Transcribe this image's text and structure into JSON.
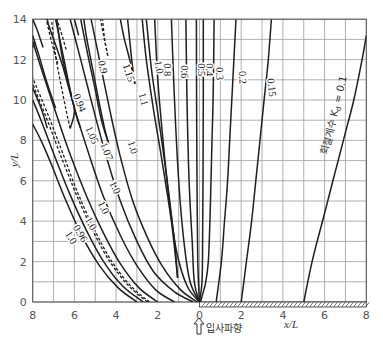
{
  "chart_data": {
    "type": "line",
    "title": "",
    "xlabel": "x/L",
    "ylabel": "y/L",
    "xlim": [
      -8,
      8
    ],
    "ylim": [
      0,
      14
    ],
    "x_ticks": [
      "8",
      "6",
      "4",
      "2",
      "0",
      "2",
      "4",
      "6",
      "8"
    ],
    "y_ticks": [
      "0",
      "2",
      "4",
      "6",
      "8",
      "10",
      "12",
      "14"
    ],
    "grid": true,
    "incident_wave_label": "입사파향",
    "breakwater": {
      "from_x": 0,
      "to_x": 8,
      "pattern": "hatched"
    },
    "legend_annotation": "회절계수 K",
    "legend_annotation_sub": "d",
    "legend_annotation_value": " = 0.1",
    "series": [
      {
        "name": "0.1",
        "style": "solid",
        "points": [
          [
            5.0,
            0
          ],
          [
            5.4,
            2
          ],
          [
            5.9,
            4
          ],
          [
            6.4,
            6
          ],
          [
            6.9,
            8
          ],
          [
            7.4,
            10
          ],
          [
            7.8,
            12
          ],
          [
            8.0,
            13.2
          ]
        ],
        "label": {
          "text": "회절계수 K_d = 0.1",
          "x": 6.6,
          "y": 9.2,
          "rot": -76
        }
      },
      {
        "name": "0.15",
        "style": "solid",
        "points": [
          [
            2.0,
            0
          ],
          [
            2.25,
            2
          ],
          [
            2.5,
            4
          ],
          [
            2.7,
            6
          ],
          [
            2.9,
            8
          ],
          [
            3.1,
            10
          ],
          [
            3.3,
            12
          ],
          [
            3.45,
            14
          ]
        ],
        "label": {
          "text": "0.15",
          "x": 3.3,
          "y": 10.6,
          "rot": 84
        }
      },
      {
        "name": "0.2",
        "style": "solid",
        "points": [
          [
            0.8,
            0
          ],
          [
            1.05,
            2
          ],
          [
            1.2,
            4
          ],
          [
            1.35,
            6
          ],
          [
            1.45,
            8
          ],
          [
            1.55,
            10
          ],
          [
            1.65,
            12
          ],
          [
            1.75,
            14
          ]
        ],
        "label": {
          "text": "0.2",
          "x": 1.9,
          "y": 11.1,
          "rot": 86
        }
      },
      {
        "name": "0.3",
        "style": "solid",
        "points": [
          [
            0.05,
            0
          ],
          [
            0.3,
            1
          ],
          [
            0.42,
            2
          ],
          [
            0.5,
            4
          ],
          [
            0.55,
            6
          ],
          [
            0.6,
            8
          ],
          [
            0.65,
            10
          ],
          [
            0.68,
            12
          ],
          [
            0.7,
            14
          ]
        ],
        "label": {
          "text": "0.3",
          "x": 0.8,
          "y": 11.3,
          "rot": 88
        }
      },
      {
        "name": "0.4",
        "style": "solid",
        "points": [
          [
            0,
            0
          ],
          [
            0.12,
            1
          ],
          [
            0.15,
            3
          ],
          [
            0.17,
            6
          ],
          [
            0.18,
            10
          ],
          [
            0.18,
            14
          ]
        ],
        "label": {
          "text": "0.4",
          "x": 0.3,
          "y": 11.5,
          "rot": 90
        }
      },
      {
        "name": "0.5",
        "style": "solid",
        "points": [
          [
            0,
            0
          ],
          [
            -0.08,
            2
          ],
          [
            -0.12,
            6
          ],
          [
            -0.14,
            10
          ],
          [
            -0.15,
            14
          ]
        ],
        "label": {
          "text": "0.5",
          "x": -0.05,
          "y": 11.5,
          "rot": 90
        }
      },
      {
        "name": "0.6",
        "style": "solid",
        "points": [
          [
            0,
            0
          ],
          [
            -0.25,
            1
          ],
          [
            -0.35,
            3
          ],
          [
            -0.5,
            6
          ],
          [
            -0.6,
            10
          ],
          [
            -0.65,
            14
          ]
        ],
        "label": {
          "text": "0.6",
          "x": -0.9,
          "y": 11.4,
          "rot": 90
        }
      },
      {
        "name": "0.8",
        "style": "solid",
        "points": [
          [
            0,
            0
          ],
          [
            -0.45,
            1
          ],
          [
            -0.75,
            3
          ],
          [
            -1.0,
            6
          ],
          [
            -1.2,
            10
          ],
          [
            -1.35,
            14
          ]
        ],
        "label": {
          "text": "0.8",
          "x": -1.7,
          "y": 11.5,
          "rot": 90
        }
      },
      {
        "name": "1.0a",
        "style": "solid",
        "points": [
          [
            0,
            0
          ],
          [
            -0.6,
            0.8
          ],
          [
            -1.1,
            2.5
          ],
          [
            -1.45,
            5
          ],
          [
            -1.75,
            8
          ],
          [
            -2.0,
            11
          ],
          [
            -2.15,
            14
          ]
        ],
        "label": {
          "text": "1.0",
          "x": -2.1,
          "y": 11.6,
          "rot": 80
        }
      },
      {
        "name": "1.1",
        "style": "solid",
        "points": [
          [
            -1.05,
            1.2
          ],
          [
            -1.35,
            4
          ],
          [
            -1.8,
            7
          ],
          [
            -2.2,
            9.5
          ],
          [
            -2.55,
            12
          ],
          [
            -2.75,
            14
          ]
        ],
        "label": {
          "text": "1.1",
          "x": -2.85,
          "y": 10.0,
          "rot": 75
        }
      },
      {
        "name": "1.1b",
        "style": "solid",
        "points": [
          [
            -1.05,
            1.2
          ],
          [
            -1.2,
            3
          ],
          [
            -1.55,
            6
          ],
          [
            -1.95,
            9
          ],
          [
            -2.3,
            11.5
          ],
          [
            -2.55,
            14
          ]
        ],
        "label": null
      },
      {
        "name": "1.15",
        "style": "solid",
        "points": [
          [
            -3.1,
            10.8
          ],
          [
            -3.25,
            12
          ],
          [
            -3.45,
            14
          ]
        ],
        "label": {
          "text": "1.15",
          "x": -3.55,
          "y": 11.3,
          "rot": 72
        }
      },
      {
        "name": "1.15b",
        "style": "solid",
        "points": [
          [
            -3.1,
            10.8
          ],
          [
            -3.3,
            11.8
          ],
          [
            -3.6,
            13
          ],
          [
            -3.8,
            14
          ]
        ],
        "label": null
      },
      {
        "name": "0.9",
        "style": "dashed",
        "points": [
          [
            -4.4,
            12.2
          ],
          [
            -4.6,
            13.2
          ],
          [
            -4.75,
            14
          ]
        ],
        "label": {
          "text": "0.9",
          "x": -4.8,
          "y": 11.6,
          "rot": 78
        }
      },
      {
        "name": "0.9b",
        "style": "dashed",
        "points": [
          [
            -4.4,
            12.2
          ],
          [
            -4.55,
            13
          ],
          [
            -4.65,
            14
          ]
        ],
        "label": null
      },
      {
        "name": "1.0b",
        "style": "solid",
        "points": [
          [
            -0.1,
            0
          ],
          [
            -0.9,
            0.6
          ],
          [
            -1.8,
            1.8
          ],
          [
            -2.5,
            3.2
          ],
          [
            -3.2,
            5
          ],
          [
            -3.8,
            7.2
          ],
          [
            -4.3,
            9.5
          ],
          [
            -4.8,
            12
          ],
          [
            -5.2,
            14
          ]
        ],
        "label": {
          "text": "1.0",
          "x": -3.35,
          "y": 7.6,
          "rot": 70
        }
      },
      {
        "name": "1.07",
        "style": "solid",
        "points": [
          [
            -4.35,
            7.8
          ],
          [
            -4.55,
            8.6
          ],
          [
            -4.8,
            9.8
          ],
          [
            -5.1,
            11.4
          ],
          [
            -5.4,
            13
          ],
          [
            -5.55,
            14
          ]
        ],
        "label": {
          "text": "1.07",
          "x": -4.6,
          "y": 7.4,
          "rot": 68
        }
      },
      {
        "name": "1.07b",
        "style": "solid",
        "points": [
          [
            -4.35,
            7.8
          ],
          [
            -4.7,
            9
          ],
          [
            -5.0,
            10.5
          ],
          [
            -5.35,
            12.2
          ],
          [
            -5.7,
            14
          ]
        ],
        "label": null
      },
      {
        "name": "1.0c",
        "style": "solid",
        "points": [
          [
            -0.3,
            0
          ],
          [
            -1.2,
            0.5
          ],
          [
            -2.2,
            1.5
          ],
          [
            -3.0,
            3
          ],
          [
            -3.8,
            5
          ],
          [
            -4.5,
            7.3
          ],
          [
            -5.1,
            9.6
          ],
          [
            -5.7,
            12
          ],
          [
            -6.2,
            14
          ]
        ],
        "label": {
          "text": "1.0",
          "x": -4.2,
          "y": 5.6,
          "rot": 65
        }
      },
      {
        "name": "0.94",
        "style": "solid",
        "points": [
          [
            -6.2,
            8.6
          ],
          [
            -6.0,
            9.5
          ],
          [
            -6.3,
            10.8
          ],
          [
            -6.6,
            12.2
          ],
          [
            -6.85,
            14
          ]
        ],
        "label": {
          "text": "0.94",
          "x": -5.9,
          "y": 9.8,
          "rot": 68
        }
      },
      {
        "name": "0.94b",
        "style": "dashed",
        "points": [
          [
            -6.2,
            8.6
          ],
          [
            -6.4,
            9.5
          ],
          [
            -6.65,
            10.8
          ],
          [
            -6.9,
            12.2
          ],
          [
            -7.1,
            14
          ]
        ],
        "label": null
      },
      {
        "name": "1.05",
        "style": "solid",
        "points": [
          [
            -5.7,
            8.6
          ],
          [
            -5.9,
            9.2
          ],
          [
            -6.2,
            10.5
          ],
          [
            -6.5,
            12
          ],
          [
            -6.9,
            14
          ]
        ],
        "label": {
          "text": "1.05",
          "x": -5.3,
          "y": 8.2,
          "rot": 66
        }
      },
      {
        "name": "1.0d",
        "style": "solid",
        "points": [
          [
            -1.2,
            0
          ],
          [
            -2.1,
            0.6
          ],
          [
            -3.0,
            1.8
          ],
          [
            -3.8,
            3.3
          ],
          [
            -4.6,
            5.2
          ],
          [
            -5.3,
            7.3
          ],
          [
            -6.0,
            9.6
          ],
          [
            -6.6,
            11.8
          ],
          [
            -7.2,
            13.6
          ],
          [
            -7.3,
            14
          ]
        ],
        "label": {
          "text": "1.0",
          "x": -4.75,
          "y": 4.6,
          "rot": 62
        }
      },
      {
        "name": "1.0e",
        "style": "solid",
        "points": [
          [
            -2.0,
            0
          ],
          [
            -2.9,
            0.7
          ],
          [
            -3.8,
            1.9
          ],
          [
            -4.6,
            3.4
          ],
          [
            -5.4,
            5.2
          ],
          [
            -6.2,
            7.3
          ],
          [
            -6.9,
            9.4
          ],
          [
            -7.6,
            11.6
          ],
          [
            -8.0,
            12.9
          ]
        ],
        "label": {
          "text": "1.0",
          "x": -5.35,
          "y": 3.8,
          "rot": 60
        }
      },
      {
        "name": "0.96",
        "style": "dashed",
        "points": [
          [
            -2.4,
            0
          ],
          [
            -3.3,
            0.8
          ],
          [
            -4.2,
            2.0
          ],
          [
            -5.0,
            3.5
          ],
          [
            -5.8,
            5.3
          ],
          [
            -6.5,
            7.2
          ],
          [
            -7.2,
            9.1
          ],
          [
            -8.0,
            11.1
          ]
        ],
        "label": {
          "text": "0.96",
          "x": -5.85,
          "y": 3.3,
          "rot": 58
        }
      },
      {
        "name": "0.96b",
        "style": "dashed",
        "points": [
          [
            -2.5,
            0
          ],
          [
            -3.4,
            0.8
          ],
          [
            -4.3,
            2.0
          ],
          [
            -5.1,
            3.5
          ],
          [
            -5.9,
            5.3
          ],
          [
            -6.6,
            7.1
          ],
          [
            -7.3,
            9.0
          ],
          [
            -8.0,
            10.8
          ]
        ],
        "label": null
      },
      {
        "name": "1.0f",
        "style": "solid",
        "points": [
          [
            -2.7,
            0
          ],
          [
            -3.7,
            0.8
          ],
          [
            -4.6,
            2.0
          ],
          [
            -5.4,
            3.5
          ],
          [
            -6.2,
            5.3
          ],
          [
            -6.9,
            7.1
          ],
          [
            -7.6,
            9.0
          ],
          [
            -8.0,
            10.0
          ]
        ],
        "label": {
          "text": "1.0",
          "x": -6.3,
          "y": 3.1,
          "rot": 58
        }
      },
      {
        "name": "edge1",
        "style": "solid",
        "points": [
          [
            -3.0,
            0
          ],
          [
            -3.9,
            0.7
          ],
          [
            -4.8,
            1.8
          ],
          [
            -5.6,
            3.2
          ],
          [
            -6.4,
            5.0
          ],
          [
            -7.1,
            6.8
          ],
          [
            -7.6,
            8.0
          ],
          [
            -8.0,
            8.8
          ]
        ],
        "label": null
      },
      {
        "name": "top1",
        "style": "solid",
        "points": [
          [
            -7.3,
            8.6
          ],
          [
            -7.6,
            9.6
          ],
          [
            -8.0,
            10.6
          ]
        ],
        "label": null
      },
      {
        "name": "top2",
        "style": "solid",
        "points": [
          [
            -6.9,
            9.6
          ],
          [
            -7.3,
            10.8
          ],
          [
            -7.7,
            12.2
          ],
          [
            -8.0,
            13.2
          ]
        ],
        "label": null
      },
      {
        "name": "top3",
        "style": "solid",
        "points": [
          [
            -7.5,
            12.6
          ],
          [
            -7.8,
            13.5
          ],
          [
            -8.0,
            14
          ]
        ],
        "label": null
      },
      {
        "name": "top4",
        "style": "dashed",
        "points": [
          [
            -6.8,
            11.8
          ],
          [
            -7.1,
            12.9
          ],
          [
            -7.35,
            14
          ]
        ],
        "label": null
      },
      {
        "name": "top5",
        "style": "dashed",
        "points": [
          [
            -6.4,
            12.5
          ],
          [
            -6.65,
            13.4
          ],
          [
            -6.85,
            14
          ]
        ],
        "label": null
      },
      {
        "name": "top6",
        "style": "solid",
        "points": [
          [
            -5.8,
            13.2
          ],
          [
            -6.0,
            14
          ]
        ],
        "label": null
      },
      {
        "name": "top7",
        "style": "solid",
        "points": [
          [
            -8.0,
            12.6
          ],
          [
            -7.9,
            12.9
          ]
        ],
        "label": null
      }
    ]
  }
}
